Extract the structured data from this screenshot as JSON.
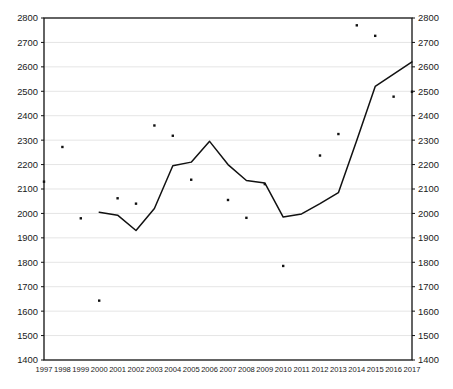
{
  "chart_data": {
    "type": "line",
    "title": "",
    "subtitle": "",
    "xlabel": "",
    "ylabel": "",
    "xlim": [
      1997,
      2017
    ],
    "ylim": [
      1400,
      2800
    ],
    "y_tick_step": 100,
    "grid": true,
    "legend": "none",
    "dual_y_axis": true,
    "x": [
      1997,
      1998,
      1999,
      2000,
      2001,
      2002,
      2003,
      2004,
      2005,
      2006,
      2007,
      2008,
      2009,
      2010,
      2011,
      2012,
      2013,
      2014,
      2015,
      2016,
      2017
    ],
    "categories": [
      "1997",
      "1998",
      "1999",
      "2000",
      "2001",
      "2002",
      "2003",
      "2004",
      "2005",
      "2006",
      "2007",
      "2008",
      "2009",
      "2010",
      "2011",
      "2012",
      "2013",
      "2014",
      "2015",
      "2016",
      "2017"
    ],
    "ytick_labels": [
      "1400",
      "1500",
      "1600",
      "1700",
      "1800",
      "1900",
      "2000",
      "2100",
      "2200",
      "2300",
      "2400",
      "2500",
      "2600",
      "2700",
      "2800"
    ],
    "ytick_values": [
      1400,
      1500,
      1600,
      1700,
      1800,
      1900,
      2000,
      2100,
      2200,
      2300,
      2400,
      2500,
      2600,
      2700,
      2800
    ],
    "series": [
      {
        "name": "line-series",
        "style": "line",
        "color": "#111111",
        "x": [
          2000,
          2001,
          2002,
          2003,
          2004,
          2005,
          2006,
          2007,
          2008,
          2009,
          2010,
          2011,
          2012,
          2013,
          2014,
          2015,
          2016,
          2017
        ],
        "values": [
          2005,
          1993,
          1930,
          2020,
          2195,
          2210,
          2295,
          2200,
          2135,
          2125,
          1985,
          1998,
          2040,
          2085,
          2300,
          2520,
          2570,
          2620
        ]
      },
      {
        "name": "scatter-series",
        "style": "scatter",
        "color": "#111111",
        "x": [
          1997,
          1998,
          1999,
          2000,
          2001,
          2002,
          2003,
          2004,
          2005,
          2007,
          2008,
          2009,
          2010,
          2012,
          2013,
          2014,
          2015,
          2016,
          2017
        ],
        "values": [
          2130,
          2272,
          1980,
          1643,
          2062,
          2040,
          2360,
          2318,
          2138,
          2055,
          1982,
          2120,
          1785,
          2237,
          2325,
          2770,
          2727,
          2478,
          2498
        ]
      }
    ]
  },
  "layout": {
    "plot_left": 44,
    "plot_right": 412,
    "plot_top": 18,
    "plot_bottom": 360
  }
}
